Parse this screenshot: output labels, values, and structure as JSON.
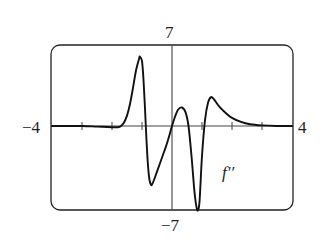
{
  "chart_data": {
    "type": "line",
    "title": "",
    "xlabel": "",
    "ylabel": "",
    "xlim": [
      -4,
      4
    ],
    "ylim": [
      -7,
      7
    ],
    "x_tick_step": 1,
    "grid": false,
    "legend": null,
    "axis_labels": {
      "x_min": "−4",
      "x_max": "4",
      "y_min": "−7",
      "y_max": "7"
    },
    "series": [
      {
        "name": "f''",
        "label": "f′′",
        "color": "#111111",
        "x": [
          -4.0,
          -3.0,
          -2.5,
          -2.0,
          -1.8,
          -1.7,
          -1.6,
          -1.5,
          -1.4,
          -1.3,
          -1.2,
          -1.1,
          -1.07,
          -1.0,
          -0.95,
          -0.9,
          -0.85,
          -0.8,
          -0.75,
          -0.7,
          -0.67,
          -0.6,
          -0.5,
          -0.4,
          -0.3,
          -0.2,
          -0.1,
          0.0,
          0.1,
          0.2,
          0.33,
          0.45,
          0.55,
          0.65,
          0.75,
          0.82,
          0.87,
          0.92,
          1.0,
          1.1,
          1.2,
          1.3,
          1.4,
          1.6,
          1.8,
          2.0,
          2.3,
          2.6,
          3.0,
          3.5,
          4.0
        ],
        "y": [
          0.0,
          0.0,
          -0.05,
          -0.1,
          -0.1,
          0.0,
          0.3,
          0.9,
          1.9,
          3.3,
          4.8,
          5.8,
          6.0,
          5.6,
          4.0,
          1.5,
          -1.2,
          -3.3,
          -4.5,
          -4.9,
          -4.9,
          -4.5,
          -3.8,
          -3.1,
          -2.4,
          -1.7,
          -0.9,
          0.0,
          0.8,
          1.4,
          1.6,
          1.2,
          0.0,
          -2.5,
          -5.5,
          -6.8,
          -7.0,
          -6.2,
          -2.5,
          0.5,
          2.0,
          2.5,
          2.3,
          1.6,
          1.1,
          0.7,
          0.35,
          0.15,
          0.05,
          0.0,
          0.0
        ]
      }
    ],
    "annotations": [
      {
        "text": "f′′",
        "x": 1.7,
        "y": -3.5
      }
    ]
  }
}
